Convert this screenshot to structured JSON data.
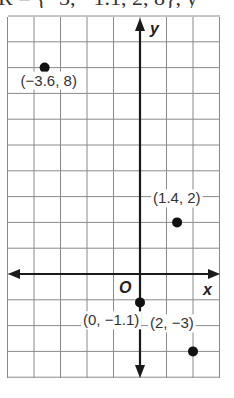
{
  "header_fragment": "R = {−3, −1.1, 2, 8}, y",
  "chart_data": {
    "type": "scatter",
    "title": "",
    "xlabel": "x",
    "ylabel": "y",
    "origin_label": "O",
    "grid": true,
    "xlim": [
      -5,
      3
    ],
    "ylim": [
      -4,
      10
    ],
    "points": [
      {
        "x": -3.6,
        "y": 8,
        "label": "(−3.6, 8)"
      },
      {
        "x": 1.4,
        "y": 2,
        "label": "(1.4, 2)"
      },
      {
        "x": 0,
        "y": -1.1,
        "label": "(0, −1.1)"
      },
      {
        "x": 2,
        "y": -3,
        "label": "(2, −3)"
      }
    ],
    "colors": {
      "grid": "#8a8a8a",
      "axis": "#1a1a1a",
      "point": "#111111"
    }
  }
}
